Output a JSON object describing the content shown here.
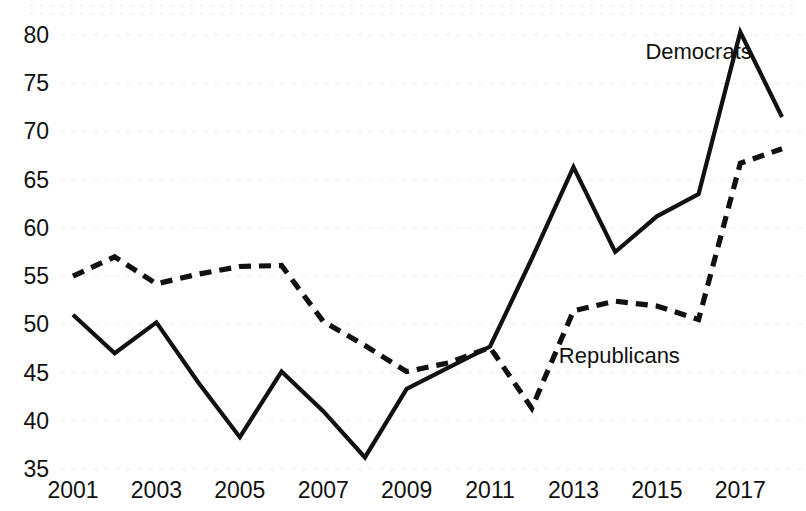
{
  "chart_data": {
    "type": "line",
    "title": "",
    "subtitle": "",
    "xlabel": "",
    "ylabel": "",
    "x": [
      2001,
      2002,
      2003,
      2004,
      2005,
      2006,
      2007,
      2008,
      2009,
      2010,
      2011,
      2012,
      2013,
      2014,
      2015,
      2016,
      2017,
      2018
    ],
    "xtick_labels": [
      "2001",
      "2003",
      "2005",
      "2007",
      "2009",
      "2011",
      "2013",
      "2015",
      "2017"
    ],
    "xtick_values": [
      2001,
      2003,
      2005,
      2007,
      2009,
      2011,
      2013,
      2015,
      2017
    ],
    "ytick_labels": [
      "35",
      "40",
      "45",
      "50",
      "55",
      "60",
      "65",
      "70",
      "75",
      "80"
    ],
    "ytick_values": [
      35,
      40,
      45,
      50,
      55,
      60,
      65,
      70,
      75,
      80
    ],
    "xlim": [
      2001,
      2018
    ],
    "ylim": [
      35,
      80
    ],
    "grid": true,
    "grid_axis": "y",
    "legend_position": "inline-annotation",
    "series": [
      {
        "name": "Democrats",
        "style": "solid",
        "color": "#111111",
        "label_position": {
          "x": 2016.0,
          "y": 77.5
        },
        "values": [
          51.0,
          47.0,
          50.2,
          44.0,
          38.3,
          45.1,
          41.0,
          36.2,
          43.3,
          45.5,
          47.7,
          56.8,
          66.3,
          57.5,
          61.2,
          63.5,
          80.3,
          71.5
        ]
      },
      {
        "name": "Republicans",
        "style": "dashed",
        "color": "#111111",
        "label_position": {
          "x": 2014.1,
          "y": 46.0
        },
        "values": [
          55.0,
          57.0,
          54.2,
          55.2,
          56.0,
          56.1,
          50.3,
          47.8,
          45.1,
          46.0,
          47.6,
          41.3,
          51.4,
          52.4,
          51.9,
          50.5,
          66.7,
          68.2
        ]
      }
    ]
  }
}
